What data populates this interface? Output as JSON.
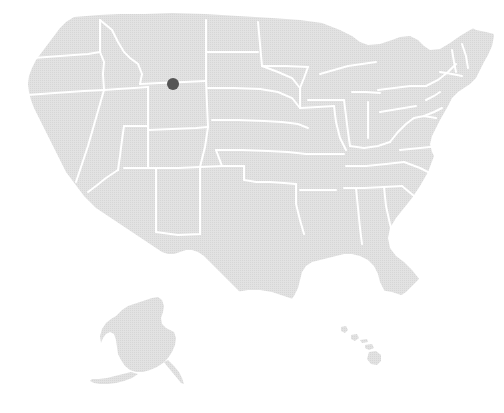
{
  "figure": {
    "type": "locator-map",
    "region": "United States",
    "width": 504,
    "height": 413,
    "background_color": "#ffffff",
    "title": "",
    "caption": "",
    "legend": null,
    "axis_labels": null
  },
  "map": {
    "projection_style": "albers-usa",
    "land_fill_color": "#dedede",
    "land_texture": "halftone-dots",
    "border_color": "#ffffff",
    "border_width_px": 2,
    "insets": [
      {
        "name": "alaska",
        "included": true
      },
      {
        "name": "hawaii",
        "included": true
      }
    ],
    "regions": [
      {
        "name": "contiguous-united-states",
        "fill": "#dedede"
      },
      {
        "name": "alaska",
        "fill": "#dedede"
      },
      {
        "name": "hawaii",
        "fill": "#dedede"
      }
    ]
  },
  "markers": [
    {
      "id": "marker-1",
      "label": "",
      "shape": "circle",
      "color": "#545454",
      "radius_px": 6,
      "x": 173,
      "y": 84,
      "located_in": "Montana / Wyoming border region"
    }
  ],
  "chart_data": {
    "type": "scatter",
    "title": "",
    "xlabel": "",
    "ylabel": "",
    "points": [
      {
        "x": 173,
        "y": 84,
        "value": 1,
        "label": ""
      }
    ],
    "series": [
      {
        "name": "highlighted-location",
        "values": [
          1
        ],
        "color": "#545454"
      }
    ],
    "categories": [
      "highlighted-location"
    ],
    "legend_position": "none",
    "grid": false
  }
}
